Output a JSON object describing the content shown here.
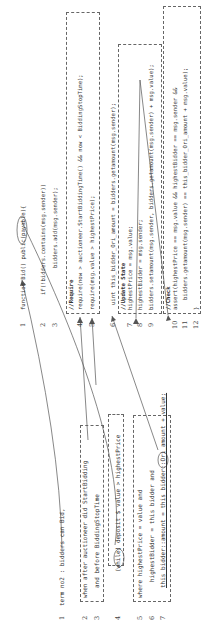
{
  "figure": {
    "left_panel": {
      "title": "Specification",
      "lines": [
        {
          "num": "1",
          "text": "term no2 : bidders can Bid,"
        },
        {
          "num": "2",
          "text": "when after auctioneer did StartBidding"
        },
        {
          "num": "3",
          "text": "and before BiddingStopTime"
        },
        {
          "num": "4",
          "text": "(while) deposit $ value > highestPrice"
        },
        {
          "num": "5",
          "text": "where highestPrice = value and"
        },
        {
          "num": "6",
          "text": "highestBidder = this bidder and"
        },
        {
          "num": "7",
          "text": "this bidder::amount = this bidder::Ori_amount + value;"
        }
      ]
    },
    "right_panel": {
      "title": "Code",
      "lines": [
        {
          "num": "1",
          "text": "function Bid() public(payable){"
        },
        {
          "num": "2",
          "text": "if(!bidders.contains(msg.sender))"
        },
        {
          "num": "3",
          "text": "bidders.add(msg.sender);"
        },
        {
          "num": "4",
          "text": "//Require"
        },
        {
          "num": "4b",
          "text": "require(now > auctioneer.StartBiddingTime() && now < BiddingStopTime);"
        },
        {
          "num": "5",
          "text": "require(msg.value > highestPrice);"
        },
        {
          "num": "6",
          "text": "uint this_bidder_Ori_amount = bidders.getamount(msg.sender);"
        },
        {
          "num": "7",
          "text": "//Update State"
        },
        {
          "num": "7b",
          "text": "highestPrice = msg.value;"
        },
        {
          "num": "8",
          "text": "highestBidder = msg.sender;"
        },
        {
          "num": "9",
          "text": "bidders.setamount(msg.sender, bidders.getamount(msg.sender) + msg.value);"
        },
        {
          "num": "10",
          "text": "//Check"
        },
        {
          "num": "10b",
          "text": "assert(highestPrice == msg.value && highestBidder == msg.sender &&"
        },
        {
          "num": "11",
          "text": "bidders.getamount(msg.sender) == this_bidder_Ori_amount + msg.value);"
        },
        {
          "num": "12",
          "text": "}"
        }
      ]
    }
  }
}
